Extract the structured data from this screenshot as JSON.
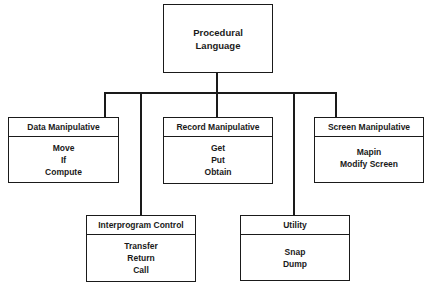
{
  "root": {
    "lines": [
      "Procedural",
      "Language"
    ]
  },
  "categories": [
    {
      "id": "data-manipulative",
      "title": "Data Manipulative",
      "items": [
        "Move",
        "If",
        "Compute"
      ]
    },
    {
      "id": "record-manipulative",
      "title": "Record Manipulative",
      "items": [
        "Get",
        "Put",
        "Obtain"
      ]
    },
    {
      "id": "screen-manipulative",
      "title": "Screen Manipulative",
      "items": [
        "Mapin",
        "Modify Screen"
      ]
    },
    {
      "id": "interprogram-control",
      "title": "Interprogram Control",
      "items": [
        "Transfer",
        "Return",
        "Call"
      ]
    },
    {
      "id": "utility",
      "title": "Utility",
      "items": [
        "Snap",
        "Dump"
      ]
    }
  ]
}
